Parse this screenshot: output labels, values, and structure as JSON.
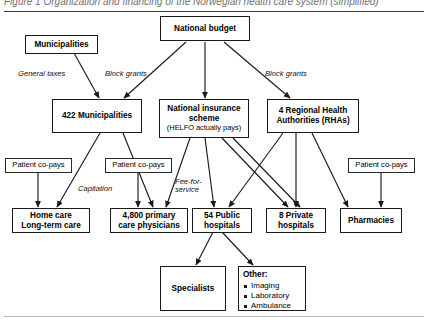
{
  "figure": {
    "caption_clipped": "Figure 1  Organization and financing of the Norwegian health care system (simplified)",
    "type": "flow-diagram"
  },
  "nodes": {
    "national_budget": {
      "label": "National budget"
    },
    "municipalities_src": {
      "label": "Municipalities"
    },
    "municipalities_422": {
      "label": "422 Municipalities"
    },
    "insurance": {
      "label": "National insurance scheme",
      "sublabel": "(HELFO actually pays)"
    },
    "rhas": {
      "label": "4 Regional Health Authorities (RHAs)"
    },
    "copay_left": {
      "label": "Patient co-pays"
    },
    "copay_mid": {
      "label": "Patient co-pays"
    },
    "copay_right": {
      "label": "Patient co-pays"
    },
    "home_care": {
      "label": "Home care Long-term care"
    },
    "primary_care": {
      "label": "4,800 primary care physicians"
    },
    "public_hospitals": {
      "label": "54 Public hospitals"
    },
    "private_hospitals": {
      "label": "8 Private hospitals"
    },
    "pharmacies": {
      "label": "Pharmacies"
    },
    "specialists": {
      "label": "Specialists"
    },
    "other": {
      "header": "Other:",
      "items": [
        "Imaging",
        "Laboratory",
        "Ambulance"
      ]
    }
  },
  "edge_labels": {
    "general_taxes": "General taxes",
    "block_grants_left": "Block grants",
    "block_grants_right": "Block grants",
    "capitation": "Capitation",
    "fee_for_service": "Fee-for-service"
  },
  "colors": {
    "stroke": "#1a1a1a",
    "background": "#ffffff",
    "rule": "#3a3a3a",
    "caption": "#6f6f6f"
  }
}
